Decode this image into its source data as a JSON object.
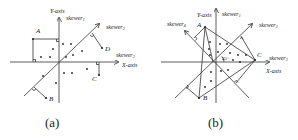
{
  "panels": [
    {
      "id": "a",
      "caption": "(a)",
      "labels": {
        "y_axis": "Y-axis",
        "x_axis": "X-axis",
        "skewer1": "skewer",
        "skewer1_sub": "1",
        "skewer2": "skewer",
        "skewer2_sub": "2",
        "skewer3": "skewer",
        "skewer3_sub": "3"
      },
      "points": {
        "A": "A",
        "B": "B",
        "C": "C",
        "D": "D"
      }
    },
    {
      "id": "b",
      "caption": "(b)",
      "labels": {
        "y_axis": "Y-axis",
        "x_axis": "X-axis",
        "skewer1": "skewer",
        "skewer1_sub": "1",
        "skewer2": "skewer",
        "skewer2_sub": "2",
        "skewer3": "skewer",
        "skewer3_sub": "3",
        "skewer4": "skewer",
        "skewer4_sub": "4",
        "angle": "45°"
      },
      "points": {
        "A": "A",
        "B": "B",
        "C": "C"
      }
    }
  ],
  "colors": {
    "stroke": "#333333",
    "text": "#222222",
    "background": "#ffffff"
  }
}
